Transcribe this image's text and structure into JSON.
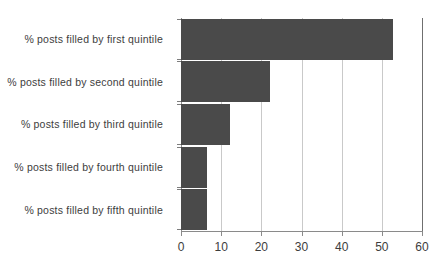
{
  "chart_data": {
    "type": "bar",
    "orientation": "horizontal",
    "title": "",
    "xlabel": "",
    "ylabel": "",
    "categories": [
      "% posts filled by first quintile",
      "% posts filled by second quintile",
      "% posts filled by third quintile",
      "% posts filled by fourth quintile",
      "% posts filled by fifth quintile"
    ],
    "values": [
      52.8,
      22.1,
      12.2,
      6.5,
      6.5
    ],
    "xlim": [
      0,
      60
    ],
    "xticks": [
      0,
      10,
      20,
      30,
      40,
      50,
      60
    ],
    "xtick_labels": [
      "0",
      "10",
      "20",
      "30",
      "40",
      "50",
      "60"
    ],
    "grid": "vertical",
    "legend": "none",
    "bar_color": "#4a4a4a",
    "gridline_color": "#c9c9c9",
    "axis_color": "#8a8a8a",
    "text_color": "#3d3d3d",
    "background_color": "#ffffff"
  }
}
